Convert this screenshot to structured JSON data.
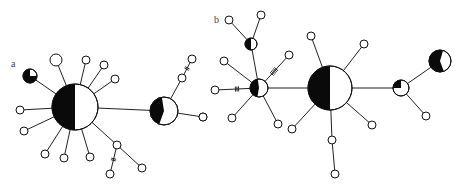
{
  "figure": {
    "width": 464,
    "height": 189,
    "colors": {
      "black": "#0a0a0a",
      "white": "#ffffff",
      "line": "#222222",
      "label": "#444444"
    }
  },
  "panels": [
    {
      "id": "a",
      "label": "a",
      "label_pos": [
        11,
        67
      ],
      "nodes": [
        {
          "id": "a-hub",
          "x": 75,
          "y": 107,
          "r": 23,
          "black_fraction": 0.5,
          "black_start_deg": 180
        },
        {
          "id": "a-hub2",
          "x": 164,
          "y": 111,
          "r": 14,
          "black_fraction": 0.42,
          "black_start_deg": 200
        },
        {
          "id": "a-mixed",
          "x": 30,
          "y": 76,
          "r": 7,
          "black_fraction": 0.75,
          "black_start_deg": 90
        },
        {
          "id": "a-w1",
          "x": 56,
          "y": 60,
          "r": 6,
          "black_fraction": 0
        },
        {
          "id": "a-w2",
          "x": 86,
          "y": 60,
          "r": 4,
          "black_fraction": 0
        },
        {
          "id": "a-w3",
          "x": 104,
          "y": 65,
          "r": 4,
          "black_fraction": 0
        },
        {
          "id": "a-w4",
          "x": 115,
          "y": 79,
          "r": 4,
          "black_fraction": 0
        },
        {
          "id": "a-b1",
          "x": 20,
          "y": 110,
          "r": 4,
          "black_fraction": 1
        },
        {
          "id": "a-b2",
          "x": 24,
          "y": 131,
          "r": 4,
          "black_fraction": 1
        },
        {
          "id": "a-b3",
          "x": 45,
          "y": 154,
          "r": 4,
          "black_fraction": 1
        },
        {
          "id": "a-b4",
          "x": 64,
          "y": 158,
          "r": 4,
          "black_fraction": 1
        },
        {
          "id": "a-b5",
          "x": 90,
          "y": 157,
          "r": 4,
          "black_fraction": 1
        },
        {
          "id": "a-b6",
          "x": 117,
          "y": 145,
          "r": 4,
          "black_fraction": 1
        },
        {
          "id": "a-b7",
          "x": 110,
          "y": 174,
          "r": 4,
          "black_fraction": 1
        },
        {
          "id": "a-w5",
          "x": 142,
          "y": 168,
          "r": 4,
          "black_fraction": 0
        },
        {
          "id": "a-w6",
          "x": 182,
          "y": 78,
          "r": 4,
          "black_fraction": 0
        },
        {
          "id": "a-b8",
          "x": 192,
          "y": 59,
          "r": 4,
          "black_fraction": 1
        },
        {
          "id": "a-w7",
          "x": 203,
          "y": 117,
          "r": 4,
          "black_fraction": 0
        }
      ],
      "edges": [
        {
          "from": "a-hub",
          "to": "a-hub2",
          "ticks": 0
        },
        {
          "from": "a-hub",
          "to": "a-mixed",
          "ticks": 0
        },
        {
          "from": "a-hub",
          "to": "a-w1",
          "ticks": 0
        },
        {
          "from": "a-hub",
          "to": "a-w2",
          "ticks": 0
        },
        {
          "from": "a-hub",
          "to": "a-w3",
          "ticks": 0
        },
        {
          "from": "a-hub",
          "to": "a-w4",
          "ticks": 0
        },
        {
          "from": "a-hub",
          "to": "a-b1",
          "ticks": 0
        },
        {
          "from": "a-hub",
          "to": "a-b2",
          "ticks": 0
        },
        {
          "from": "a-hub",
          "to": "a-b3",
          "ticks": 0
        },
        {
          "from": "a-hub",
          "to": "a-b4",
          "ticks": 0
        },
        {
          "from": "a-hub",
          "to": "a-b5",
          "ticks": 0
        },
        {
          "from": "a-hub",
          "to": "a-b6",
          "ticks": 0
        },
        {
          "from": "a-b6",
          "to": "a-b7",
          "ticks": 2
        },
        {
          "from": "a-b6",
          "to": "a-w5",
          "ticks": 0
        },
        {
          "from": "a-hub2",
          "to": "a-w6",
          "ticks": 0
        },
        {
          "from": "a-w6",
          "to": "a-b8",
          "ticks": 2
        },
        {
          "from": "a-hub2",
          "to": "a-w7",
          "ticks": 0
        }
      ]
    },
    {
      "id": "b",
      "label": "b",
      "label_pos": [
        214,
        23
      ],
      "nodes": [
        {
          "id": "b-hub",
          "x": 330,
          "y": 88,
          "r": 22,
          "black_fraction": 0.5,
          "black_start_deg": 180
        },
        {
          "id": "b-hub2",
          "x": 259,
          "y": 88,
          "r": 9,
          "black_fraction": 0.45,
          "black_start_deg": 190
        },
        {
          "id": "b-hub3",
          "x": 401,
          "y": 88,
          "r": 8,
          "black_fraction": 0.25,
          "black_start_deg": 270
        },
        {
          "id": "b-big",
          "x": 440,
          "y": 61,
          "r": 11,
          "black_fraction": 0.6,
          "black_start_deg": 160
        },
        {
          "id": "b-mid",
          "x": 251,
          "y": 44,
          "r": 6,
          "black_fraction": 0.5,
          "black_start_deg": 180
        },
        {
          "id": "b-b1",
          "x": 229,
          "y": 20,
          "r": 4,
          "black_fraction": 1
        },
        {
          "id": "b-b2",
          "x": 261,
          "y": 15,
          "r": 4,
          "black_fraction": 1
        },
        {
          "id": "b-b3",
          "x": 224,
          "y": 61,
          "r": 4,
          "black_fraction": 1
        },
        {
          "id": "b-b4",
          "x": 215,
          "y": 90,
          "r": 4,
          "black_fraction": 1
        },
        {
          "id": "b-w1",
          "x": 289,
          "y": 55,
          "r": 4,
          "black_fraction": 0
        },
        {
          "id": "b-w2",
          "x": 203,
          "y": 117,
          "r": 4,
          "black_fraction": 0
        },
        {
          "id": "b-w3",
          "x": 232,
          "y": 118,
          "r": 4,
          "black_fraction": 0
        },
        {
          "id": "b-b5",
          "x": 278,
          "y": 124,
          "r": 4,
          "black_fraction": 1
        },
        {
          "id": "b-b6",
          "x": 311,
          "y": 36,
          "r": 4,
          "black_fraction": 1
        },
        {
          "id": "b-w4",
          "x": 364,
          "y": 44,
          "r": 4,
          "black_fraction": 0
        },
        {
          "id": "b-w5",
          "x": 292,
          "y": 129,
          "r": 4,
          "black_fraction": 0
        },
        {
          "id": "b-w6",
          "x": 372,
          "y": 125,
          "r": 4,
          "black_fraction": 0
        },
        {
          "id": "b-b7",
          "x": 332,
          "y": 140,
          "r": 4,
          "black_fraction": 1
        },
        {
          "id": "b-b8",
          "x": 335,
          "y": 174,
          "r": 4,
          "black_fraction": 1
        },
        {
          "id": "b-w7",
          "x": 426,
          "y": 116,
          "r": 4,
          "black_fraction": 0
        }
      ],
      "edges": [
        {
          "from": "b-hub",
          "to": "b-hub2",
          "ticks": 0
        },
        {
          "from": "b-hub",
          "to": "b-hub3",
          "ticks": 0
        },
        {
          "from": "b-hub3",
          "to": "b-big",
          "ticks": 0
        },
        {
          "from": "b-hub3",
          "to": "b-w7",
          "ticks": 0
        },
        {
          "from": "b-hub2",
          "to": "b-mid",
          "ticks": 0
        },
        {
          "from": "b-mid",
          "to": "b-b1",
          "ticks": 0
        },
        {
          "from": "b-mid",
          "to": "b-b2",
          "ticks": 0
        },
        {
          "from": "b-hub2",
          "to": "b-b3",
          "ticks": 0
        },
        {
          "from": "b-hub2",
          "to": "b-b4",
          "ticks": 3
        },
        {
          "from": "b-hub2",
          "to": "b-w1",
          "ticks": 5
        },
        {
          "from": "b-hub2",
          "to": "b-w3",
          "ticks": 0
        },
        {
          "from": "b-hub2",
          "to": "b-b5",
          "ticks": 0
        },
        {
          "from": "b-hub",
          "to": "b-b6",
          "ticks": 0
        },
        {
          "from": "b-hub",
          "to": "b-w4",
          "ticks": 0
        },
        {
          "from": "b-hub",
          "to": "b-w5",
          "ticks": 0
        },
        {
          "from": "b-hub",
          "to": "b-w6",
          "ticks": 0
        },
        {
          "from": "b-hub",
          "to": "b-b7",
          "ticks": 0
        },
        {
          "from": "b-b7",
          "to": "b-b8",
          "ticks": 0
        }
      ]
    }
  ]
}
